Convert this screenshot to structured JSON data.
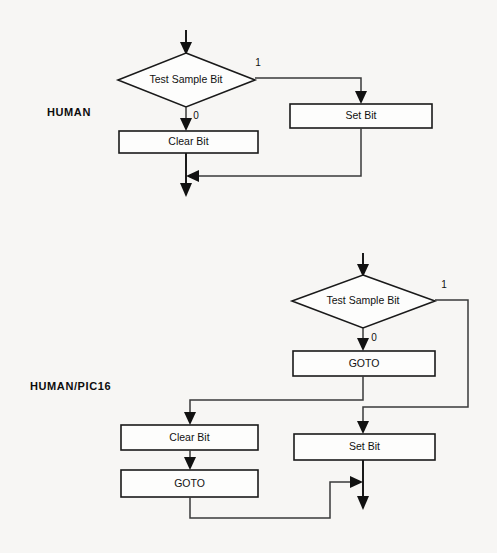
{
  "page": {
    "background_color": "#f7f6f4",
    "line_color": "#1a1a1a",
    "shape_fill": "#fdfdfc"
  },
  "diagrams": [
    {
      "id": "human",
      "section_label": "HUMAN",
      "nodes": {
        "decision": "Test Sample Bit",
        "false_action": "Clear Bit",
        "true_action": "Set Bit"
      },
      "branch_labels": {
        "true": "1",
        "false": "0"
      }
    },
    {
      "id": "human-pic16",
      "section_label": "HUMAN/PIC16",
      "nodes": {
        "decision": "Test Sample Bit",
        "false_goto": "GOTO",
        "false_action": "Clear Bit",
        "false_return_goto": "GOTO",
        "true_action": "Set Bit"
      },
      "branch_labels": {
        "true": "1",
        "false": "0"
      }
    }
  ]
}
